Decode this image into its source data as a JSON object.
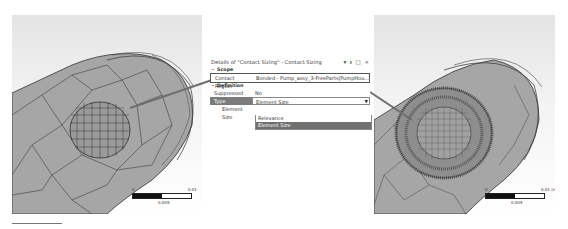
{
  "details_panel": {
    "title": "Details of \"Contact Sizing\" - Contact Sizing",
    "title_icons": {
      "dropdown": "▾",
      "pin": "ᵻ",
      "maximize": "□",
      "close": "×"
    },
    "scope": {
      "header": "Scope",
      "contact_region": {
        "label": "Contact Region",
        "value": "Bonded - Pump_assy_3-FreeParts|PumpHou..."
      }
    },
    "definition": {
      "header": "Definition",
      "suppressed": {
        "label": "Suppressed",
        "value": "No"
      },
      "type": {
        "label": "Type",
        "value": "Element Size"
      },
      "element_size": {
        "label": "Element Size"
      }
    },
    "type_dropdown": {
      "options": [
        "Relevance",
        "Element Size"
      ],
      "selected": "Element Size"
    }
  },
  "left_view": {
    "scale": {
      "min": "0",
      "max": "0.01",
      "mid": "0.005"
    }
  },
  "right_view": {
    "scale": {
      "min": "0",
      "max": "0.01 (m)",
      "mid": "0.005"
    }
  },
  "colors": {
    "mesh_fill": "#a8a8a8",
    "mesh_line": "#2a2a2a",
    "callout_arrow": "#6e6e6e",
    "selected_row": "#707070"
  }
}
